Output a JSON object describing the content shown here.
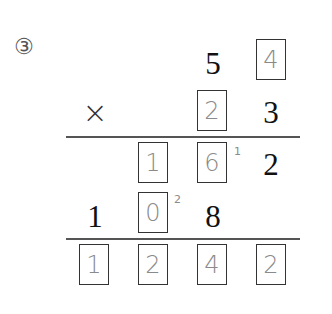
{
  "problem_number": "③",
  "multiplicand": {
    "tens": "5",
    "ones_answer": "4"
  },
  "multiplier": {
    "operator": "×",
    "tens_answer": "2",
    "ones": "3"
  },
  "partial_product_1": {
    "hundreds_answer": "1",
    "tens_answer": "6",
    "carry_mark": "1",
    "ones": "2"
  },
  "partial_product_2": {
    "thousands": "1",
    "hundreds_answer": "0",
    "carry_mark": "2",
    "tens": "8"
  },
  "final_product": {
    "digits_answer": [
      "1",
      "2",
      "4",
      "2"
    ]
  },
  "colors": {
    "printed": "#111111",
    "handwritten": "#8a8a8a",
    "box_border": "#333333",
    "rule": "#555555"
  }
}
